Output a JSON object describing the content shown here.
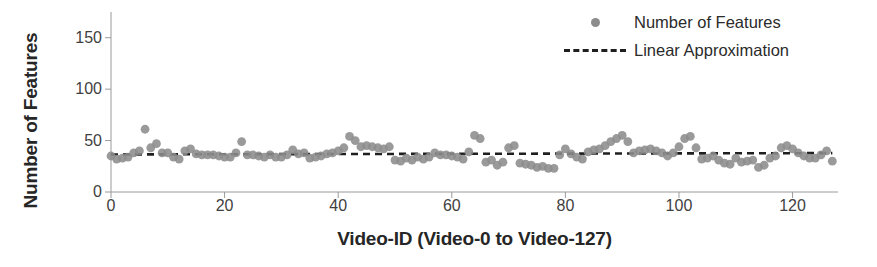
{
  "chart_data": {
    "type": "scatter",
    "title": "",
    "xlabel": "Video-ID (Video-0 to Video-127)",
    "ylabel": "Number of Features",
    "xlim": [
      0,
      128
    ],
    "ylim": [
      0,
      175
    ],
    "xticks": [
      0,
      20,
      40,
      60,
      80,
      100,
      120
    ],
    "yticks": [
      0,
      50,
      100,
      150
    ],
    "grid": false,
    "legend_position": "top-right",
    "series": [
      {
        "name": "Number of Features",
        "type": "scatter",
        "color": "#8c8c8c",
        "marker": "circle",
        "x": [
          0,
          1,
          2,
          3,
          4,
          5,
          6,
          7,
          8,
          9,
          10,
          11,
          12,
          13,
          14,
          15,
          16,
          17,
          18,
          19,
          20,
          21,
          22,
          23,
          24,
          25,
          26,
          27,
          28,
          29,
          30,
          31,
          32,
          33,
          34,
          35,
          36,
          37,
          38,
          39,
          40,
          41,
          42,
          43,
          44,
          45,
          46,
          47,
          48,
          49,
          50,
          51,
          52,
          53,
          54,
          55,
          56,
          57,
          58,
          59,
          60,
          61,
          62,
          63,
          64,
          65,
          66,
          67,
          68,
          69,
          70,
          71,
          72,
          73,
          74,
          75,
          76,
          77,
          78,
          79,
          80,
          81,
          82,
          83,
          84,
          85,
          86,
          87,
          88,
          89,
          90,
          91,
          92,
          93,
          94,
          95,
          96,
          97,
          98,
          99,
          100,
          101,
          102,
          103,
          104,
          105,
          106,
          107,
          108,
          109,
          110,
          111,
          112,
          113,
          114,
          115,
          116,
          117,
          118,
          119,
          120,
          121,
          122,
          123,
          124,
          125,
          126,
          127
        ],
        "y": [
          35,
          32,
          33,
          34,
          38,
          40,
          61,
          43,
          47,
          38,
          38,
          34,
          32,
          40,
          42,
          37,
          36,
          36,
          36,
          35,
          34,
          34,
          38,
          49,
          36,
          36,
          35,
          34,
          36,
          34,
          34,
          36,
          41,
          37,
          38,
          33,
          34,
          35,
          37,
          38,
          40,
          43,
          54,
          50,
          44,
          45,
          44,
          43,
          42,
          44,
          31,
          30,
          33,
          31,
          34,
          32,
          34,
          38,
          36,
          36,
          35,
          34,
          32,
          39,
          55,
          52,
          29,
          31,
          26,
          29,
          43,
          45,
          28,
          27,
          26,
          24,
          25,
          23,
          23,
          36,
          42,
          37,
          34,
          32,
          39,
          41,
          42,
          45,
          49,
          52,
          55,
          49,
          38,
          40,
          41,
          42,
          40,
          38,
          35,
          38,
          44,
          52,
          54,
          43,
          32,
          33,
          35,
          31,
          28,
          27,
          33,
          29,
          30,
          31,
          24,
          26,
          33,
          35,
          43,
          45,
          42,
          38,
          35,
          33,
          33,
          36,
          40,
          30
        ]
      },
      {
        "name": "Linear Approximation",
        "type": "line",
        "style": "dashed",
        "color": "#1f1f1f",
        "x": [
          0,
          127
        ],
        "y": [
          36.5,
          37.8
        ]
      }
    ]
  },
  "legend": {
    "items": [
      {
        "label": "Number of Features",
        "marker": "dot-marker"
      },
      {
        "label": "Linear Approximation",
        "marker": "dashed-line-marker"
      }
    ]
  },
  "axes": {
    "x_tick_labels": [
      "0",
      "20",
      "40",
      "60",
      "80",
      "100",
      "120"
    ],
    "y_tick_labels": [
      "0",
      "50",
      "100",
      "150"
    ]
  },
  "colors": {
    "point": "#8c8c8c",
    "trendline": "#1f1f1f",
    "axis": "#9a9a9a",
    "text": "#2b2b2b"
  }
}
